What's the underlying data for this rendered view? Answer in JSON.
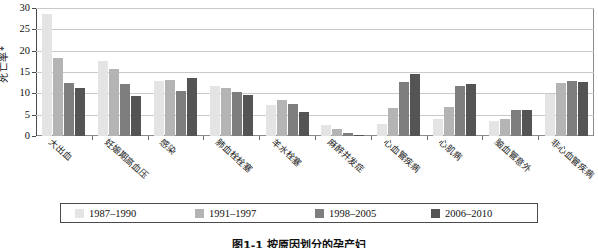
{
  "chart_data": {
    "type": "bar",
    "title": "",
    "xlabel": "",
    "ylabel": "死亡率*",
    "ylim": [
      0,
      30
    ],
    "yticks": [
      0,
      5,
      10,
      15,
      20,
      25,
      30
    ],
    "ytick_labels": [
      "0",
      "5",
      "10",
      "15",
      "20",
      "25",
      "30"
    ],
    "grid": true,
    "legend_position": "bottom",
    "categories": [
      "大出血",
      "妊娠期高血压",
      "感染",
      "肺血栓栓塞",
      "羊水栓塞",
      "麻醉并发症",
      "心血管疾病",
      "心肌病",
      "脑血管意外",
      "非心血管疾病"
    ],
    "series": [
      {
        "name": "1987–1990",
        "color": "#e4e4e4",
        "values": [
          28.7,
          17.5,
          13.0,
          11.7,
          7.3,
          2.5,
          2.7,
          4.0,
          3.5,
          9.9
        ]
      },
      {
        "name": "1991–1997",
        "color": "#b4b4b4",
        "values": [
          18.2,
          15.8,
          13.1,
          11.3,
          8.4,
          1.6,
          6.5,
          6.8,
          4.1,
          12.4
        ]
      },
      {
        "name": "1998–2005",
        "color": "#7e7e7e",
        "values": [
          12.4,
          12.2,
          10.6,
          10.2,
          7.4,
          0.8,
          12.6,
          11.8,
          6.1,
          12.9
        ]
      },
      {
        "name": "2006–2010",
        "color": "#545454",
        "values": [
          11.3,
          9.3,
          13.5,
          9.6,
          5.6,
          0.3,
          14.6,
          12.1,
          6.1,
          12.6
        ]
      }
    ]
  },
  "caption": "图1-1 按原因划分的孕产妇"
}
